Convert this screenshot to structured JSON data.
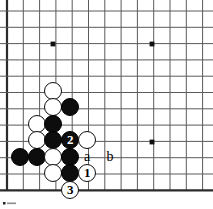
{
  "figure": {
    "kind": "go-board-diagram",
    "width": 213,
    "height": 209,
    "background_color": "#ffffff",
    "line_color": "#5a5a5a",
    "border_color": "#2b2b2b",
    "black_stone_color": "#0d0d0d",
    "white_stone_color": "#ffffff",
    "stone_outline_color": "#111111"
  },
  "board": {
    "origin_x": 7,
    "origin_y": 11,
    "spacing": 16.3,
    "cols": 13,
    "rows": 12,
    "edges": [
      "left",
      "bottom"
    ],
    "star_points": [
      {
        "x": 53,
        "y": 44
      },
      {
        "x": 152,
        "y": 44
      },
      {
        "x": 152,
        "y": 142
      }
    ]
  },
  "stones": [
    {
      "id": "w1",
      "color": "white",
      "x": 53,
      "y": 91,
      "label": ""
    },
    {
      "id": "w2",
      "color": "white",
      "x": 53,
      "y": 107,
      "label": ""
    },
    {
      "id": "b1",
      "color": "black",
      "x": 70,
      "y": 107,
      "label": ""
    },
    {
      "id": "w3",
      "color": "white",
      "x": 37,
      "y": 124,
      "label": ""
    },
    {
      "id": "b2",
      "color": "black",
      "x": 53,
      "y": 124,
      "label": ""
    },
    {
      "id": "w4",
      "color": "white",
      "x": 37,
      "y": 140,
      "label": ""
    },
    {
      "id": "b3",
      "color": "black",
      "x": 53,
      "y": 140,
      "label": ""
    },
    {
      "id": "b4",
      "color": "black",
      "x": 70,
      "y": 140,
      "label": "2"
    },
    {
      "id": "w5",
      "color": "white",
      "x": 87,
      "y": 140,
      "label": ""
    },
    {
      "id": "b5",
      "color": "black",
      "x": 20,
      "y": 157,
      "label": ""
    },
    {
      "id": "b6",
      "color": "black",
      "x": 37,
      "y": 157,
      "label": ""
    },
    {
      "id": "w6",
      "color": "white",
      "x": 53,
      "y": 157,
      "label": ""
    },
    {
      "id": "b7",
      "color": "black",
      "x": 70,
      "y": 157,
      "label": ""
    },
    {
      "id": "w7",
      "color": "white",
      "x": 53,
      "y": 173,
      "label": ""
    },
    {
      "id": "b8",
      "color": "black",
      "x": 70,
      "y": 173,
      "label": ""
    },
    {
      "id": "w8",
      "color": "white",
      "x": 87,
      "y": 173,
      "label": "1"
    },
    {
      "id": "w9",
      "color": "white",
      "x": 70,
      "y": 190,
      "label": "3"
    }
  ],
  "point_labels": [
    {
      "id": "pa",
      "text": "a",
      "x": 87,
      "y": 157
    },
    {
      "id": "pb",
      "text": "b",
      "x": 110,
      "y": 157
    }
  ],
  "move_markers": {
    "move_1": "1",
    "move_2": "2",
    "move_3": "3"
  },
  "alpha_markers": {
    "a": "a",
    "b": "b"
  }
}
